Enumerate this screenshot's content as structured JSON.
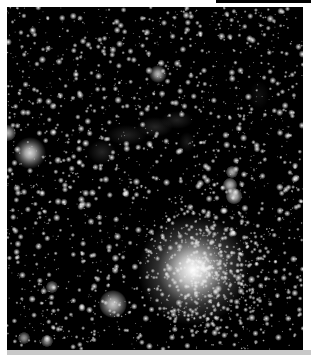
{
  "window": {
    "top_bar_color": "#000000",
    "bottom_bar_color": "#c8c8c8",
    "background_color": "#ffffff"
  },
  "image": {
    "subject": "star field with nebula",
    "background_color": "#000000",
    "width": 296,
    "height": 343,
    "bright_stars": [
      {
        "x": 186,
        "y": 263,
        "radius": 14,
        "halo": 55,
        "brightness": 1.0
      },
      {
        "x": 23,
        "y": 146,
        "radius": 5,
        "halo": 16,
        "brightness": 0.85
      },
      {
        "x": 106,
        "y": 297,
        "radius": 5,
        "halo": 14,
        "brightness": 0.8
      },
      {
        "x": 151,
        "y": 67,
        "radius": 3,
        "halo": 9,
        "brightness": 0.75
      },
      {
        "x": 225,
        "y": 165,
        "radius": 2.5,
        "halo": 6,
        "brightness": 0.7
      },
      {
        "x": 223,
        "y": 178,
        "radius": 3,
        "halo": 7,
        "brightness": 0.75
      },
      {
        "x": 227,
        "y": 189,
        "radius": 3.5,
        "halo": 8,
        "brightness": 0.8
      },
      {
        "x": 1,
        "y": 126,
        "radius": 3,
        "halo": 8,
        "brightness": 0.7
      },
      {
        "x": 45,
        "y": 280,
        "radius": 2.5,
        "halo": 6,
        "brightness": 0.6
      },
      {
        "x": 17,
        "y": 331,
        "radius": 2.5,
        "halo": 6,
        "brightness": 0.6
      },
      {
        "x": 40,
        "y": 334,
        "radius": 2.5,
        "halo": 6,
        "brightness": 0.6
      }
    ],
    "nebula_patches": [
      {
        "x": 95,
        "y": 145,
        "rx": 14,
        "ry": 12,
        "opacity": 0.22
      },
      {
        "x": 120,
        "y": 128,
        "rx": 20,
        "ry": 10,
        "opacity": 0.2
      },
      {
        "x": 148,
        "y": 120,
        "rx": 18,
        "ry": 10,
        "opacity": 0.22
      },
      {
        "x": 170,
        "y": 113,
        "rx": 16,
        "ry": 9,
        "opacity": 0.2
      },
      {
        "x": 180,
        "y": 135,
        "rx": 8,
        "ry": 10,
        "opacity": 0.16
      },
      {
        "x": 252,
        "y": 88,
        "rx": 10,
        "ry": 14,
        "opacity": 0.1
      },
      {
        "x": 215,
        "y": 250,
        "rx": 45,
        "ry": 45,
        "opacity": 0.08
      }
    ],
    "star_count": 1800,
    "cluster": {
      "x": 200,
      "y": 262,
      "radius": 65,
      "count": 450
    }
  }
}
